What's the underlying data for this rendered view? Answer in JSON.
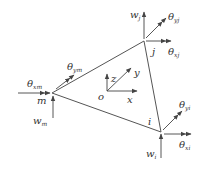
{
  "diagram": {
    "type": "triangular plate element",
    "nodes": {
      "m": {
        "label": "m",
        "x": 52,
        "y": 93
      },
      "j": {
        "label": "j",
        "x": 144,
        "y": 41
      },
      "i": {
        "label": "i",
        "x": 161,
        "y": 132
      }
    },
    "axes": {
      "origin_label": "o",
      "x_label": "x",
      "y_label": "y",
      "z_label": "z"
    },
    "dofs": {
      "m": {
        "w": "w",
        "w_sub": "m",
        "theta_x": "θ",
        "theta_x_sub": "xm",
        "theta_y": "θ",
        "theta_y_sub": "ym"
      },
      "j": {
        "w": "w",
        "w_sub": "j",
        "theta_x": "θ",
        "theta_x_sub": "xj",
        "theta_y": "θ",
        "theta_y_sub": "yj"
      },
      "i": {
        "w": "w",
        "w_sub": "i",
        "theta_x": "θ",
        "theta_x_sub": "xi",
        "theta_y": "θ",
        "theta_y_sub": "yi"
      }
    },
    "colors": {
      "line": "#555555",
      "text": "#333333",
      "background": "#ffffff"
    }
  }
}
